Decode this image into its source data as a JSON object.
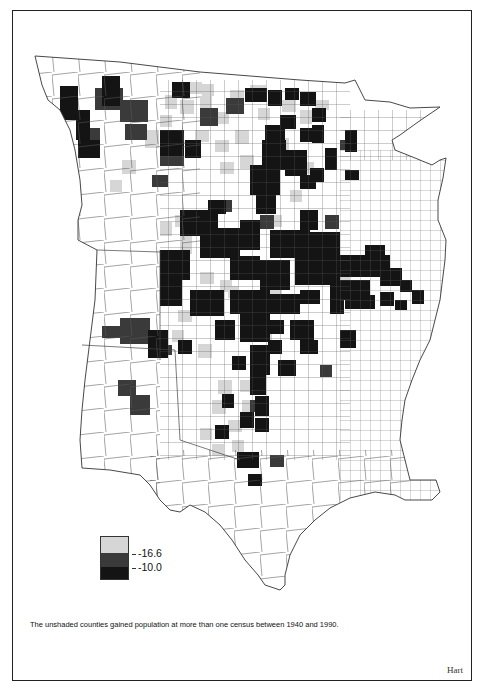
{
  "map": {
    "region": "Great Plains, central United States (county level)",
    "subject": "County population loss, 1940-1990",
    "colors": {
      "unshaded": "#ffffff",
      "light": "#d6d6d6",
      "medium": "#3a3a3a",
      "dark": "#141414",
      "boundary": "#555555"
    }
  },
  "legend": {
    "label_high": "-16.6",
    "label_low": "-10.0"
  },
  "caption": "The unshaded counties gained population at more than one census between 1940 and 1990.",
  "credit": "Hart"
}
